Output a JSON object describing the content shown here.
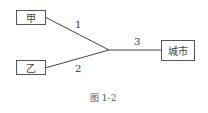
{
  "nodes": {
    "jia": "甲",
    "yi": "乙",
    "city": "城市"
  },
  "edges": {
    "e1": "1",
    "e2": "2",
    "e3": "3"
  },
  "caption": "图 1-2",
  "colors": {
    "line": "#444444",
    "border": "#555555"
  }
}
